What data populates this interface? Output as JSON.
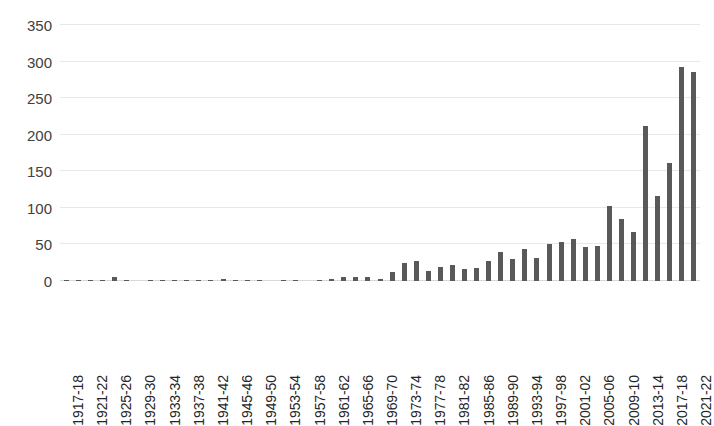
{
  "chart_data": {
    "type": "bar",
    "title": "",
    "subtitle": "",
    "xlabel": "",
    "ylabel": "",
    "ylim": [
      0,
      350
    ],
    "yticks": [
      0,
      50,
      100,
      150,
      200,
      250,
      300,
      350
    ],
    "grid": true,
    "legend": false,
    "legend_position": "none",
    "bar_color": "#595959",
    "gridline_color": "#e8e8e8",
    "categories": [
      "1917-18",
      "1919-20",
      "1921-22",
      "1923-24",
      "1925-26",
      "1927-28",
      "1929-30",
      "1931-32",
      "1933-34",
      "1935-36",
      "1937-38",
      "1939-40",
      "1941-42",
      "1943-44",
      "1945-46",
      "1947-48",
      "1949-50",
      "1951-52",
      "1953-54",
      "1955-56",
      "1957-58",
      "1959-60",
      "1961-62",
      "1963-64",
      "1965-66",
      "1967-68",
      "1969-70",
      "1971-72",
      "1973-74",
      "1975-76",
      "1977-78",
      "1979-80",
      "1981-82",
      "1983-84",
      "1985-86",
      "1987-88",
      "1989-90",
      "1991-92",
      "1993-94",
      "1995-96",
      "1997-98",
      "1999-00",
      "2001-02",
      "2003-04",
      "2005-06",
      "2007-08",
      "2009-10",
      "2011-12",
      "2013-14",
      "2015-16",
      "2017-18",
      "2019-20",
      "2021-22"
    ],
    "values": [
      1,
      2,
      1,
      1,
      5,
      1,
      0,
      1,
      1,
      1,
      2,
      1,
      1,
      3,
      1,
      1,
      1,
      0,
      1,
      1,
      0,
      1,
      3,
      5,
      6,
      5,
      3,
      13,
      25,
      28,
      14,
      19,
      22,
      17,
      18,
      27,
      40,
      30,
      44,
      31,
      50,
      53,
      57,
      46,
      48,
      102,
      85,
      67,
      212,
      116,
      162,
      293,
      286
    ],
    "tick_label_categories": [
      "1917-18",
      "1921-22",
      "1925-26",
      "1929-30",
      "1933-34",
      "1937-38",
      "1941-42",
      "1945-46",
      "1949-50",
      "1953-54",
      "1957-58",
      "1961-62",
      "1965-66",
      "1969-70",
      "1973-74",
      "1977-78",
      "1981-82",
      "1985-86",
      "1989-90",
      "1993-94",
      "1997-98",
      "2001-02",
      "2005-06",
      "2009-10",
      "2013-14",
      "2017-18",
      "2021-22"
    ]
  }
}
